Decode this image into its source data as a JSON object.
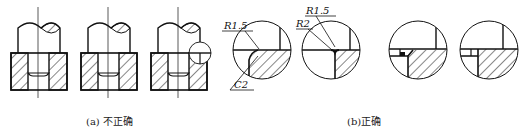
{
  "figure": {
    "part_a": {
      "caption": "(a) 不正确",
      "meaning": "incorrect",
      "views": [
        {
          "id": "a1",
          "description": "shaft seated in bored block, sharp corners"
        },
        {
          "id": "a2",
          "description": "shaft seated in bored block, sharp corners"
        },
        {
          "id": "a3",
          "description": "shaft seated in bored block, detail circle at corner"
        }
      ]
    },
    "part_b": {
      "caption": "(b)正确",
      "meaning": "correct",
      "details": [
        {
          "id": "b1",
          "labels": [
            "R1.5",
            "C2"
          ]
        },
        {
          "id": "b2",
          "labels": [
            "R1.5",
            "R2"
          ]
        },
        {
          "id": "b3",
          "labels": []
        },
        {
          "id": "b4",
          "labels": []
        }
      ]
    }
  },
  "colors": {
    "line": "#111111",
    "background": "#ffffff"
  }
}
